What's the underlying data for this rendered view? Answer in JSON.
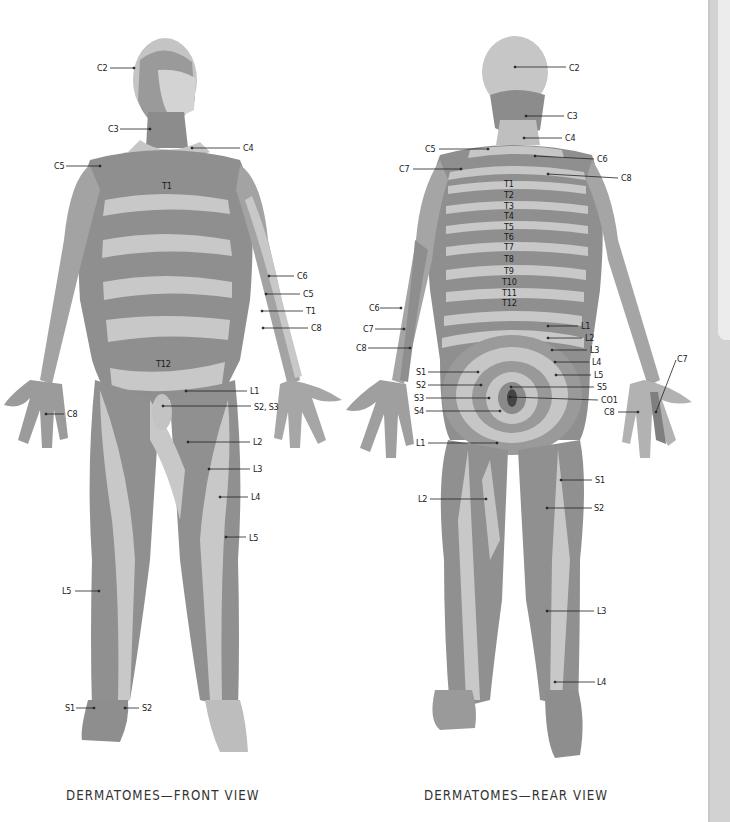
{
  "colors": {
    "skin_light": "#c9c9c9",
    "skin_dark": "#8a8a8a",
    "skin_mid": "#a8a8a8",
    "label_text": "#1a1a1a",
    "leader_line": "#222222",
    "scrollbar_track": "#d2d2d2",
    "scrollbar_thumb": "#ececec"
  },
  "front_view": {
    "caption": "DERMATOMES—FRONT VIEW",
    "labels": [
      {
        "text": "C2",
        "x": 97,
        "y": 63
      },
      {
        "text": "C3",
        "x": 108,
        "y": 124
      },
      {
        "text": "C4",
        "x": 243,
        "y": 143
      },
      {
        "text": "C5",
        "x": 54,
        "y": 161
      },
      {
        "text": "T1",
        "x": 162,
        "y": 181
      },
      {
        "text": "C6",
        "x": 297,
        "y": 271
      },
      {
        "text": "C5",
        "x": 303,
        "y": 289
      },
      {
        "text": "T1",
        "x": 306,
        "y": 306
      },
      {
        "text": "C8",
        "x": 311,
        "y": 323
      },
      {
        "text": "T12",
        "x": 156,
        "y": 359
      },
      {
        "text": "L1",
        "x": 250,
        "y": 386
      },
      {
        "text": "S2, S3",
        "x": 254,
        "y": 402
      },
      {
        "text": "C8",
        "x": 67,
        "y": 409
      },
      {
        "text": "L2",
        "x": 253,
        "y": 437
      },
      {
        "text": "L3",
        "x": 253,
        "y": 464
      },
      {
        "text": "L4",
        "x": 251,
        "y": 492
      },
      {
        "text": "L5",
        "x": 249,
        "y": 533
      },
      {
        "text": "L5",
        "x": 62,
        "y": 586
      },
      {
        "text": "S1",
        "x": 65,
        "y": 703
      },
      {
        "text": "S2",
        "x": 142,
        "y": 703
      }
    ]
  },
  "rear_view": {
    "caption": "DERMATOMES—REAR VIEW",
    "labels": [
      {
        "text": "C2",
        "x": 569,
        "y": 63
      },
      {
        "text": "C3",
        "x": 567,
        "y": 111
      },
      {
        "text": "C4",
        "x": 565,
        "y": 133
      },
      {
        "text": "C5",
        "x": 425,
        "y": 144
      },
      {
        "text": "C6",
        "x": 597,
        "y": 154
      },
      {
        "text": "C7",
        "x": 399,
        "y": 164
      },
      {
        "text": "C8",
        "x": 621,
        "y": 173
      },
      {
        "text": "T1",
        "x": 504,
        "y": 179
      },
      {
        "text": "T2",
        "x": 504,
        "y": 190
      },
      {
        "text": "T3",
        "x": 504,
        "y": 201
      },
      {
        "text": "T4",
        "x": 504,
        "y": 211
      },
      {
        "text": "T5",
        "x": 504,
        "y": 222
      },
      {
        "text": "T6",
        "x": 504,
        "y": 232
      },
      {
        "text": "T7",
        "x": 504,
        "y": 242
      },
      {
        "text": "T8",
        "x": 504,
        "y": 254
      },
      {
        "text": "T9",
        "x": 504,
        "y": 266
      },
      {
        "text": "T10",
        "x": 502,
        "y": 277
      },
      {
        "text": "T11",
        "x": 502,
        "y": 288
      },
      {
        "text": "T12",
        "x": 502,
        "y": 298
      },
      {
        "text": "C6",
        "x": 369,
        "y": 303
      },
      {
        "text": "L1",
        "x": 581,
        "y": 321
      },
      {
        "text": "C7",
        "x": 363,
        "y": 324
      },
      {
        "text": "L2",
        "x": 585,
        "y": 333
      },
      {
        "text": "C8",
        "x": 356,
        "y": 343
      },
      {
        "text": "L3",
        "x": 590,
        "y": 345
      },
      {
        "text": "L4",
        "x": 592,
        "y": 357
      },
      {
        "text": "C7",
        "x": 677,
        "y": 354
      },
      {
        "text": "S1",
        "x": 416,
        "y": 367
      },
      {
        "text": "L5",
        "x": 594,
        "y": 370
      },
      {
        "text": "S2",
        "x": 416,
        "y": 380
      },
      {
        "text": "S5",
        "x": 597,
        "y": 382
      },
      {
        "text": "S3",
        "x": 414,
        "y": 393
      },
      {
        "text": "CO1",
        "x": 601,
        "y": 395
      },
      {
        "text": "S4",
        "x": 414,
        "y": 406
      },
      {
        "text": "C8",
        "x": 604,
        "y": 407
      },
      {
        "text": "L1",
        "x": 416,
        "y": 438
      },
      {
        "text": "S1",
        "x": 595,
        "y": 475
      },
      {
        "text": "L2",
        "x": 418,
        "y": 494
      },
      {
        "text": "S2",
        "x": 594,
        "y": 503
      },
      {
        "text": "L3",
        "x": 597,
        "y": 606
      },
      {
        "text": "L4",
        "x": 597,
        "y": 677
      }
    ]
  },
  "scrollbar": {
    "thumb_top": 0,
    "thumb_height": 340
  }
}
